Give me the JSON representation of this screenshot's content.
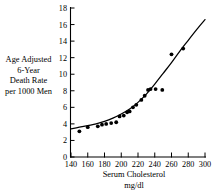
{
  "chart_data": {
    "type": "scatter",
    "title": "",
    "xlabel": "Serum Cholesterol",
    "xlabel_units": "mg/dl",
    "ylabel_lines": [
      "Age Adjusted",
      "6-Year",
      "Death Rate",
      "per 1000 Men"
    ],
    "xlim": [
      140,
      300
    ],
    "ylim": [
      0,
      18
    ],
    "xticks": [
      140,
      160,
      180,
      200,
      220,
      240,
      260,
      280,
      300
    ],
    "yticks": [
      0,
      2,
      4,
      6,
      8,
      10,
      12,
      14,
      16,
      18
    ],
    "grid": false,
    "legend": null,
    "marker_color": "#000000",
    "line_color": "#000000",
    "points": [
      {
        "x": 150,
        "y": 3.1
      },
      {
        "x": 160,
        "y": 3.6
      },
      {
        "x": 172,
        "y": 3.7
      },
      {
        "x": 177,
        "y": 3.9
      },
      {
        "x": 182,
        "y": 4.0
      },
      {
        "x": 188,
        "y": 4.1
      },
      {
        "x": 194,
        "y": 4.2
      },
      {
        "x": 198,
        "y": 4.9
      },
      {
        "x": 203,
        "y": 5.0
      },
      {
        "x": 207,
        "y": 5.4
      },
      {
        "x": 210,
        "y": 5.5
      },
      {
        "x": 214,
        "y": 6.0
      },
      {
        "x": 218,
        "y": 6.3
      },
      {
        "x": 224,
        "y": 6.9
      },
      {
        "x": 228,
        "y": 7.4
      },
      {
        "x": 232,
        "y": 8.1
      },
      {
        "x": 235,
        "y": 8.2
      },
      {
        "x": 241,
        "y": 8.2
      },
      {
        "x": 249,
        "y": 8.1
      },
      {
        "x": 260,
        "y": 12.4
      },
      {
        "x": 274,
        "y": 13.1
      }
    ],
    "fit_curve": [
      {
        "x": 140,
        "y": 3.4
      },
      {
        "x": 150,
        "y": 3.6
      },
      {
        "x": 160,
        "y": 3.8
      },
      {
        "x": 170,
        "y": 4.0
      },
      {
        "x": 180,
        "y": 4.3
      },
      {
        "x": 190,
        "y": 4.7
      },
      {
        "x": 200,
        "y": 5.2
      },
      {
        "x": 210,
        "y": 5.8
      },
      {
        "x": 220,
        "y": 6.6
      },
      {
        "x": 230,
        "y": 7.6
      },
      {
        "x": 240,
        "y": 8.8
      },
      {
        "x": 250,
        "y": 10.1
      },
      {
        "x": 260,
        "y": 11.4
      },
      {
        "x": 270,
        "y": 12.8
      },
      {
        "x": 280,
        "y": 14.1
      },
      {
        "x": 290,
        "y": 15.4
      },
      {
        "x": 300,
        "y": 16.6
      }
    ]
  },
  "axis": {
    "y_tick_labels": [
      "18",
      "16",
      "14",
      "12",
      "10",
      "8",
      "6",
      "4",
      "2",
      "0"
    ],
    "x_tick_labels": [
      "140",
      "160",
      "180",
      "200",
      "220",
      "240",
      "260",
      "280",
      "300"
    ]
  },
  "labels": {
    "y_line_1": "Age Adjusted",
    "y_line_2": "6-Year",
    "y_line_3": "Death Rate",
    "y_line_4": "per 1000 Men",
    "x_line_1": "Serum Cholesterol",
    "x_line_2": "mg/dl"
  }
}
